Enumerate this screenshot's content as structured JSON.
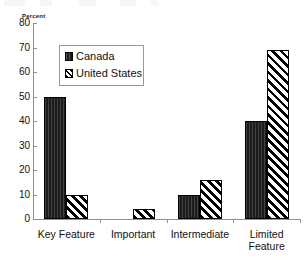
{
  "chart_data": {
    "type": "bar",
    "title": "",
    "xlabel": "",
    "ylabel": "Percent",
    "ylim": [
      0,
      80
    ],
    "ytick_step": 10,
    "yticks": [
      80,
      70,
      60,
      50,
      40,
      30,
      20,
      10,
      0
    ],
    "ytick_labels": [
      "80",
      "70",
      "60",
      "50",
      "40",
      "30",
      "20",
      "10",
      "0"
    ],
    "grid": false,
    "legend_position": "upper-left-inside",
    "categories": [
      "Key Feature",
      "Important",
      "Intermediate",
      "Limited Feature"
    ],
    "category_label_lines": [
      [
        "Key Feature"
      ],
      [
        "Important"
      ],
      [
        "Intermediate"
      ],
      [
        "Limited",
        "Feature"
      ]
    ],
    "series": [
      {
        "name": "Canada",
        "pattern": "solid-dark",
        "color": "#1c1c1c",
        "values": [
          50,
          0,
          10,
          40
        ]
      },
      {
        "name": "United States",
        "pattern": "diagonal-hatch",
        "color": "#000000",
        "values": [
          10,
          4,
          16,
          69
        ]
      }
    ]
  },
  "legend": {
    "entries": [
      {
        "label": "Canada",
        "swatch": "canada"
      },
      {
        "label": "United States",
        "swatch": "us"
      }
    ]
  },
  "axis": {
    "y_title": "Percent"
  }
}
